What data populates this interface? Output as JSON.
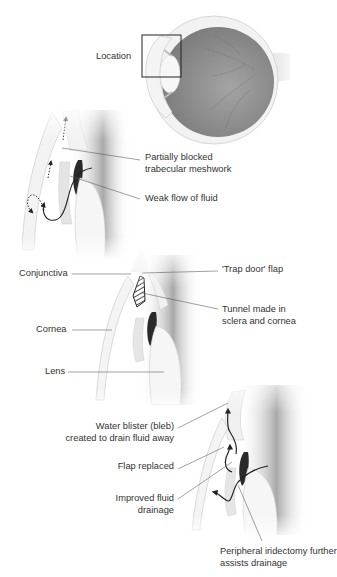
{
  "figure": {
    "panel_overview": {
      "labels": {
        "location": "Location"
      }
    },
    "panel_problem": {
      "labels": {
        "blocked_line1": "Partially blocked",
        "blocked_line2": "trabecular meshwork",
        "weak_flow": "Weak flow of fluid"
      }
    },
    "panel_procedure": {
      "labels": {
        "conjunctiva": "Conjunctiva",
        "cornea": "Cornea",
        "lens": "Lens",
        "trap_door": "'Trap door' flap",
        "tunnel_line1": "Tunnel made in",
        "tunnel_line2": "sclera and cornea"
      }
    },
    "panel_result": {
      "labels": {
        "bleb_line1": "Water blister (bleb)",
        "bleb_line2": "created to drain fluid away",
        "flap_replaced": "Flap replaced",
        "improved_line1": "Improved fluid",
        "improved_line2": "drainage",
        "iridectomy_line1": "Peripheral iridectomy further",
        "iridectomy_line2": "assists drainage"
      }
    },
    "colors": {
      "text": "#333333",
      "leader_line": "#555555",
      "arrow": "#222222",
      "retina": "#8a8a8a",
      "tissue_light": "#eeeeee",
      "tissue_shadow": "#9a9a9a"
    }
  }
}
